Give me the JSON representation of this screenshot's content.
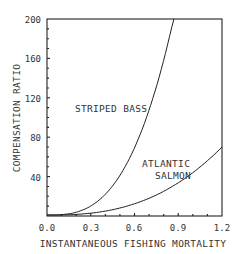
{
  "chart_data": {
    "type": "line",
    "title": "",
    "xlabel": "INSTANTANEOUS FISHING MORTALITY",
    "ylabel": "COMPENSATION RATIO",
    "xlim": [
      0.0,
      1.2
    ],
    "ylim": [
      0,
      200
    ],
    "x_ticks": [
      "0.0",
      "0.3",
      "0.6",
      "0.9",
      "1.2"
    ],
    "y_ticks": [
      "40",
      "80",
      "120",
      "160",
      "200"
    ],
    "grid": false,
    "legend": "inline labels",
    "series": [
      {
        "name": "STRIPED BASS",
        "x": [
          0.0,
          0.1,
          0.2,
          0.3,
          0.4,
          0.5,
          0.6,
          0.7,
          0.8,
          0.87
        ],
        "values": [
          1,
          1,
          3,
          10,
          21,
          40,
          68,
          106,
          156,
          200
        ]
      },
      {
        "name": "ATLANTIC SALMON",
        "x": [
          0.0,
          0.1,
          0.2,
          0.3,
          0.4,
          0.5,
          0.6,
          0.7,
          0.8,
          0.9,
          1.0,
          1.1,
          1.2
        ],
        "values": [
          1,
          1,
          2,
          2,
          4,
          7,
          11,
          17,
          24,
          33,
          43,
          55,
          70
        ]
      }
    ],
    "annotations": [
      {
        "text": "STRIPED BASS",
        "x": 0.45,
        "y": 120
      },
      {
        "text": "ATLANTIC",
        "x": 0.95,
        "y": 55
      },
      {
        "text": "SALMON",
        "x": 0.95,
        "y": 42
      }
    ]
  },
  "labels": {
    "xlabel": "INSTANTANEOUS FISHING MORTALITY",
    "ylabel": "COMPENSATION RATIO",
    "striped_bass": "STRIPED BASS",
    "atlantic": "ATLANTIC",
    "salmon": "SALMON",
    "x0": "0.0",
    "x1": "0.3",
    "x2": "0.6",
    "x3": "0.9",
    "x4": "1.2",
    "y1": "40",
    "y2": "80",
    "y3": "120",
    "y4": "160",
    "y5": "200"
  }
}
